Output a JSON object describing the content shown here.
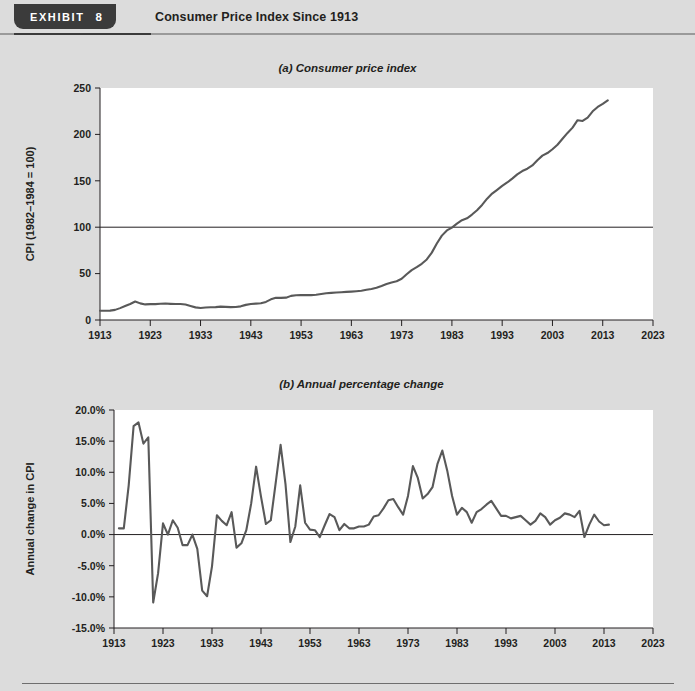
{
  "header": {
    "exhibit_word": "EXHIBIT",
    "exhibit_number": "8",
    "title": "Consumer Price Index Since 1913"
  },
  "chart_data": [
    {
      "id": "a",
      "type": "line",
      "title": "(a) Consumer price index",
      "xlabel": "",
      "ylabel": "CPI (1982–1984 = 100)",
      "xlim": [
        1913,
        2023
      ],
      "ylim": [
        0,
        250
      ],
      "xticks": [
        1913,
        1923,
        1933,
        1943,
        1953,
        1963,
        1973,
        1983,
        1993,
        2003,
        2013,
        2023
      ],
      "yticks": [
        0,
        50,
        100,
        150,
        200,
        250
      ],
      "xtick_labels": [
        "1913",
        "1923",
        "1933",
        "1943",
        "1953",
        "1963",
        "1973",
        "1983",
        "1993",
        "2003",
        "2013",
        "2023"
      ],
      "ytick_labels": [
        "0",
        "50",
        "100",
        "150",
        "200",
        "250"
      ],
      "grid": false,
      "legend": "none",
      "reference_line_y": 100,
      "x": [
        1913,
        1914,
        1915,
        1916,
        1917,
        1918,
        1919,
        1920,
        1921,
        1922,
        1923,
        1924,
        1925,
        1926,
        1927,
        1928,
        1929,
        1930,
        1931,
        1932,
        1933,
        1934,
        1935,
        1936,
        1937,
        1938,
        1939,
        1940,
        1941,
        1942,
        1943,
        1944,
        1945,
        1946,
        1947,
        1948,
        1949,
        1950,
        1951,
        1952,
        1953,
        1954,
        1955,
        1956,
        1957,
        1958,
        1959,
        1960,
        1961,
        1962,
        1963,
        1964,
        1965,
        1966,
        1967,
        1968,
        1969,
        1970,
        1971,
        1972,
        1973,
        1974,
        1975,
        1976,
        1977,
        1978,
        1979,
        1980,
        1981,
        1982,
        1983,
        1984,
        1985,
        1986,
        1987,
        1988,
        1989,
        1990,
        1991,
        1992,
        1993,
        1994,
        1995,
        1996,
        1997,
        1998,
        1999,
        2000,
        2001,
        2002,
        2003,
        2004,
        2005,
        2006,
        2007,
        2008,
        2009,
        2010,
        2011,
        2012,
        2013,
        2014
      ],
      "values": [
        9.9,
        10.0,
        10.1,
        10.9,
        12.8,
        15.1,
        17.3,
        20.0,
        17.9,
        16.8,
        17.1,
        17.1,
        17.5,
        17.7,
        17.4,
        17.2,
        17.2,
        16.7,
        15.2,
        13.6,
        12.9,
        13.4,
        13.7,
        13.9,
        14.4,
        14.1,
        13.9,
        14.0,
        14.7,
        16.3,
        17.3,
        17.6,
        18.0,
        19.5,
        22.3,
        24.0,
        23.8,
        24.1,
        26.0,
        26.6,
        26.8,
        26.9,
        26.8,
        27.2,
        28.1,
        28.9,
        29.2,
        29.6,
        29.9,
        30.3,
        30.6,
        31.0,
        31.5,
        32.5,
        33.4,
        34.8,
        36.7,
        38.8,
        40.5,
        41.8,
        44.4,
        49.3,
        53.8,
        56.9,
        60.6,
        65.2,
        72.6,
        82.4,
        90.9,
        96.5,
        99.6,
        103.9,
        107.6,
        109.6,
        113.6,
        118.3,
        124.0,
        130.7,
        136.2,
        140.3,
        144.5,
        148.2,
        152.4,
        156.9,
        160.5,
        163.0,
        166.6,
        172.2,
        177.1,
        179.9,
        184.0,
        188.9,
        195.3,
        201.6,
        207.3,
        215.3,
        214.5,
        218.1,
        224.9,
        229.6,
        233.0,
        236.7
      ]
    },
    {
      "id": "b",
      "type": "line",
      "title": "(b) Annual percentage change",
      "xlabel": "",
      "ylabel": "Annual change in CPI",
      "xlim": [
        1913,
        2023
      ],
      "ylim": [
        -15.0,
        20.0
      ],
      "xticks": [
        1913,
        1923,
        1933,
        1943,
        1953,
        1963,
        1973,
        1983,
        1993,
        2003,
        2013,
        2023
      ],
      "yticks": [
        -15.0,
        -10.0,
        -5.0,
        0.0,
        5.0,
        10.0,
        15.0,
        20.0
      ],
      "xtick_labels": [
        "1913",
        "1923",
        "1933",
        "1943",
        "1953",
        "1963",
        "1973",
        "1983",
        "1993",
        "2003",
        "2013",
        "2023"
      ],
      "ytick_labels": [
        "-15.0%",
        "-10.0%",
        "-5.0%",
        "0.0%",
        "5.0%",
        "10.0%",
        "15.0%",
        "20.0%"
      ],
      "grid": false,
      "legend": "none",
      "reference_line_y": 0,
      "x": [
        1914,
        1915,
        1916,
        1917,
        1918,
        1919,
        1920,
        1921,
        1922,
        1923,
        1924,
        1925,
        1926,
        1927,
        1928,
        1929,
        1930,
        1931,
        1932,
        1933,
        1934,
        1935,
        1936,
        1937,
        1938,
        1939,
        1940,
        1941,
        1942,
        1943,
        1944,
        1945,
        1946,
        1947,
        1948,
        1949,
        1950,
        1951,
        1952,
        1953,
        1954,
        1955,
        1956,
        1957,
        1958,
        1959,
        1960,
        1961,
        1962,
        1963,
        1964,
        1965,
        1966,
        1967,
        1968,
        1969,
        1970,
        1971,
        1972,
        1973,
        1974,
        1975,
        1976,
        1977,
        1978,
        1979,
        1980,
        1981,
        1982,
        1983,
        1984,
        1985,
        1986,
        1987,
        1988,
        1989,
        1990,
        1991,
        1992,
        1993,
        1994,
        1995,
        1996,
        1997,
        1998,
        1999,
        2000,
        2001,
        2002,
        2003,
        2004,
        2005,
        2006,
        2007,
        2008,
        2009,
        2010,
        2011,
        2012,
        2013,
        2014
      ],
      "values": [
        1.0,
        1.0,
        7.9,
        17.4,
        18.0,
        14.6,
        15.6,
        -10.9,
        -6.2,
        1.8,
        0.0,
        2.3,
        1.1,
        -1.7,
        -1.7,
        0.0,
        -2.3,
        -9.0,
        -9.9,
        -5.1,
        3.1,
        2.2,
        1.5,
        3.6,
        -2.1,
        -1.4,
        0.7,
        5.0,
        10.9,
        6.1,
        1.7,
        2.3,
        8.3,
        14.4,
        8.1,
        -1.2,
        1.3,
        7.9,
        1.9,
        0.8,
        0.7,
        -0.4,
        1.5,
        3.3,
        2.8,
        0.7,
        1.7,
        1.0,
        1.0,
        1.3,
        1.3,
        1.6,
        2.9,
        3.1,
        4.2,
        5.5,
        5.7,
        4.4,
        3.2,
        6.2,
        11.0,
        9.1,
        5.8,
        6.5,
        7.6,
        11.3,
        13.5,
        10.3,
        6.2,
        3.2,
        4.3,
        3.6,
        1.9,
        3.6,
        4.1,
        4.8,
        5.4,
        4.2,
        3.0,
        3.0,
        2.6,
        2.8,
        3.0,
        2.3,
        1.6,
        2.2,
        3.4,
        2.8,
        1.6,
        2.3,
        2.7,
        3.4,
        3.2,
        2.8,
        3.8,
        -0.4,
        1.6,
        3.2,
        2.1,
        1.5,
        1.6
      ]
    }
  ]
}
